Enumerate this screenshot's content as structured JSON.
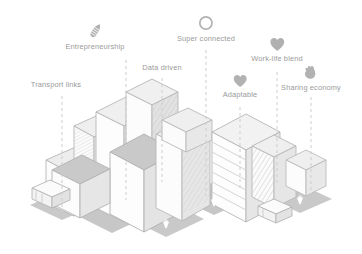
{
  "illustration": {
    "title": "Isometric city illustration with feature callouts",
    "style": "isometric line art",
    "palette": {
      "line": "#b9b9b9",
      "line_dark": "#a3a3a3",
      "fill_light": "#fbfbfb",
      "fill_mid": "#efefef",
      "fill_shade": "#e3e3e3",
      "ground": "#cfcfcf",
      "ground_dark": "#c4c4c4",
      "label_text": "#9a9a9a",
      "icon": "#b0b0b0",
      "leader_line": "#cdcdcd",
      "background": "#ffffff"
    }
  },
  "callouts": [
    {
      "id": "transport-links",
      "label": "Transport links",
      "icon": "bus-icon",
      "has_icon": false,
      "label_x": 56,
      "label_y": 84,
      "leader_x": 62,
      "leader_top": 96,
      "leader_bottom": 212
    },
    {
      "id": "entrepreneurship",
      "label": "Entrepreneurship",
      "icon": "rocket-icon",
      "has_icon": true,
      "icon_x": 89,
      "icon_y": 25,
      "label_x": 95,
      "label_y": 47,
      "leader_x": 126,
      "leader_top": 60,
      "leader_bottom": 200
    },
    {
      "id": "data-driven",
      "label": "Data driven",
      "icon": "chart-icon",
      "has_icon": false,
      "label_x": 162,
      "label_y": 67,
      "leader_x": 162,
      "leader_top": 78,
      "leader_bottom": 182
    },
    {
      "id": "super-connected",
      "label": "Super connected",
      "icon": "wifi-circle-icon",
      "has_icon": true,
      "icon_x": 205,
      "icon_y": 17,
      "label_x": 206,
      "label_y": 38,
      "leader_x": 206,
      "leader_top": 50,
      "leader_bottom": 196
    },
    {
      "id": "adaptable",
      "label": "Adaptable",
      "icon": "heart-icon",
      "has_icon": true,
      "icon_x": 238,
      "icon_y": 77,
      "label_x": 240,
      "label_y": 95,
      "leader_x": 240,
      "leader_top": 107,
      "leader_bottom": 190
    },
    {
      "id": "work-life-blend",
      "label": "Work-life blend",
      "icon": "heart-icon",
      "has_icon": true,
      "icon_x": 272,
      "icon_y": 40,
      "label_x": 277,
      "label_y": 60,
      "leader_x": 277,
      "leader_top": 72,
      "leader_bottom": 186
    },
    {
      "id": "sharing-economy",
      "label": "Sharing economy",
      "icon": "hand-icon",
      "has_icon": true,
      "icon_x": 302,
      "icon_y": 68,
      "label_x": 311,
      "label_y": 85,
      "leader_x": 311,
      "leader_top": 97,
      "leader_bottom": 194
    }
  ],
  "scene_objects": {
    "buildings": 11,
    "vehicles": 2,
    "vehicle_names": [
      "bus",
      "van"
    ],
    "trees": 4,
    "ground_plots": 5
  }
}
